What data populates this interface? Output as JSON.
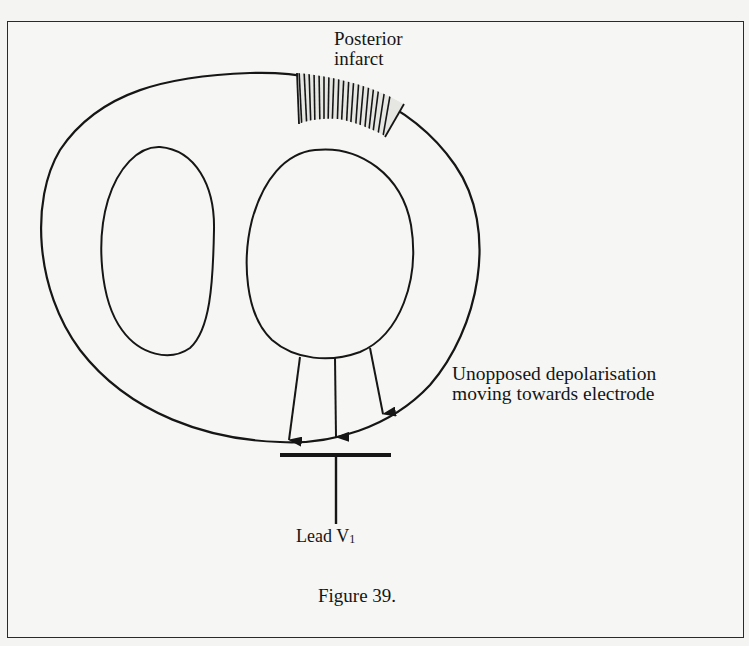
{
  "figure": {
    "caption": "Figure 39.",
    "labels": {
      "infarct_line1": "Posterior",
      "infarct_line2": "infarct",
      "depolarisation_line1": "Unopposed depolarisation",
      "depolarisation_line2": "moving towards electrode",
      "lead_name": "Lead V",
      "lead_subscript": "1"
    },
    "elements": {
      "outer_wall": "outer myocardium outline",
      "right_ventricle": "left cavity (right ventricle)",
      "left_ventricle": "right cavity (left ventricle)",
      "infarct_region": "hatched posterior infarct zone",
      "arrows_count": 3,
      "electrode": "lead V1 electrode"
    },
    "colors": {
      "ink": "#161616",
      "paper": "#f6f6f4"
    }
  }
}
